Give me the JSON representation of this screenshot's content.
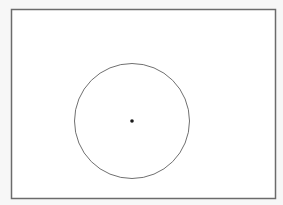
{
  "diagram": {
    "type": "geometry",
    "rectangle": {
      "x": 11.5,
      "y": 9.5,
      "width": 264,
      "height": 189,
      "stroke": "#6b6b6b",
      "stroke_width": 1.5,
      "fill": "#ffffff"
    },
    "circle": {
      "cx": 132,
      "cy": 121,
      "r": 57.5,
      "stroke": "#707070",
      "stroke_width": 1,
      "fill": "none"
    },
    "center_point": {
      "cx": 132,
      "cy": 121,
      "r": 1.8,
      "fill": "#1a1a1a"
    }
  }
}
